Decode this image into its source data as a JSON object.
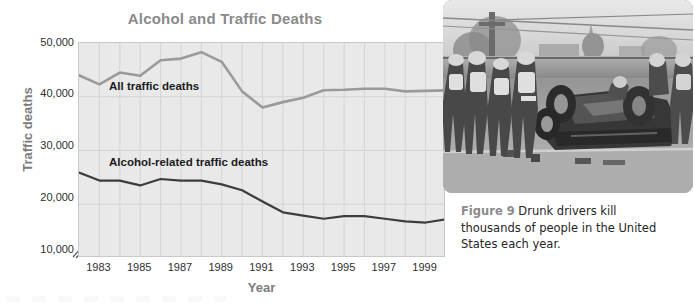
{
  "figure": {
    "title": "Alcohol and Traffic Deaths",
    "caption_figure_number": "Figure 9",
    "caption_text": "Drunk drivers kill thousands of people in the United States each year.",
    "photo_alt": "car-crash-photo"
  },
  "colors": {
    "title": "#8a8a8a",
    "axis_title": "#7c7c7c",
    "tick_label": "#2f2f2f",
    "plot_background": "#e9e9e9",
    "gridline": "#d2d2d2",
    "plot_border": "#c9c9c9",
    "series_all_traffic": "#9a9a9a",
    "series_alcohol": "#3d3d3d",
    "caption_number": "#8a8a8a",
    "caption_body": "#262626"
  },
  "chart_data": {
    "type": "line",
    "title": "Alcohol and Traffic Deaths",
    "xlabel": "Year",
    "ylabel": "Traffic deaths",
    "xlim": [
      1982,
      2000
    ],
    "ylim": [
      10000,
      50000
    ],
    "ytick_labels": [
      "10,000",
      "20,000",
      "30,000",
      "40,000",
      "50,000"
    ],
    "yticks": [
      10000,
      20000,
      30000,
      40000,
      50000
    ],
    "xtick_labels": [
      "1983",
      "1985",
      "1987",
      "1989",
      "1991",
      "1993",
      "1995",
      "1997",
      "1999"
    ],
    "xticks": [
      1983,
      1985,
      1987,
      1989,
      1991,
      1993,
      1995,
      1997,
      1999
    ],
    "y_axis_break": true,
    "grid": true,
    "legend": "inline-labels",
    "x": [
      1982,
      1983,
      1984,
      1985,
      1986,
      1987,
      1988,
      1989,
      1990,
      1991,
      1992,
      1993,
      1994,
      1995,
      1996,
      1997,
      1998,
      1999,
      2000
    ],
    "series": [
      {
        "name": "All traffic deaths",
        "color": "#9a9a9a",
        "values": [
          44000,
          42300,
          44500,
          43900,
          46800,
          47100,
          48300,
          46500,
          41000,
          38000,
          39000,
          39800,
          41200,
          41300,
          41500,
          41500,
          41000,
          41100,
          41200
        ]
      },
      {
        "name": "Alcohol-related traffic deaths",
        "color": "#3d3d3d",
        "values": [
          25900,
          24400,
          24400,
          23500,
          24700,
          24400,
          24400,
          23700,
          22600,
          20500,
          18500,
          17900,
          17300,
          17800,
          17800,
          17300,
          16800,
          16600,
          17200
        ]
      }
    ],
    "annotations": [
      {
        "text": "All traffic deaths",
        "x": 1983.5,
        "y": 41000
      },
      {
        "text": "Alcohol-related traffic deaths",
        "x": 1983.5,
        "y": 27500
      }
    ]
  }
}
